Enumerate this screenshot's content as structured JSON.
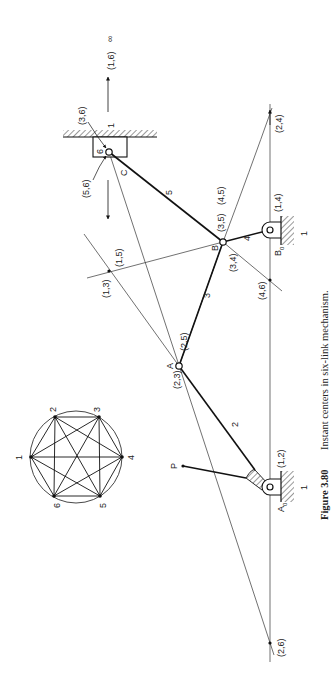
{
  "figure": {
    "caption_number": "Figure 3.80",
    "caption_text": "Instant centers in six-link mechanism."
  },
  "circle_diagram": {
    "nodes": [
      "1",
      "2",
      "3",
      "4",
      "5",
      "6"
    ],
    "edges": "all pairs connected"
  },
  "points": {
    "A": "A",
    "B": "B",
    "C": "C",
    "A0": "A",
    "A0_sub": "0",
    "B0": "B",
    "B0_sub": "0",
    "P": "P"
  },
  "links": {
    "link2": "2",
    "link3": "3",
    "link4": "4",
    "link5": "5",
    "link6": "6",
    "ground_slider": "1",
    "ground_B0": "1",
    "ground_A0": "1"
  },
  "instant_centers": {
    "ic16": "(1,6)",
    "infinity": "∞",
    "ic36": "(3,6)",
    "ic56": "(5,6)",
    "ic35": "(3,5)",
    "ic45": "(4,5)",
    "ic34": "(3,4)",
    "ic14": "(1,4)",
    "ic24": "(2,4)",
    "ic46": "(4,6)",
    "ic15": "(1,5)",
    "ic13": "(1,3)",
    "ic25": "(2,5)",
    "ic23": "(2,3)",
    "ic12": "(1,2)",
    "ic26": "(2,6)"
  }
}
